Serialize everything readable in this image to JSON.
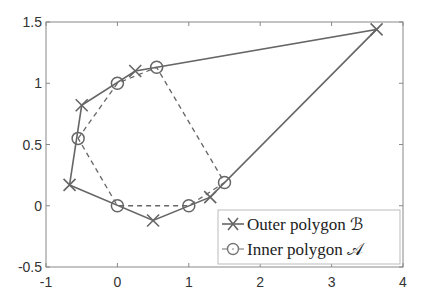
{
  "chart_data": {
    "type": "line",
    "title": "",
    "xlabel": "",
    "ylabel": "",
    "xlim": [
      -1,
      4
    ],
    "ylim": [
      -0.5,
      1.5
    ],
    "xticks": [
      -1,
      0,
      1,
      2,
      3,
      4
    ],
    "xtick_labels": [
      "-1",
      "0",
      "1",
      "2",
      "3",
      "4"
    ],
    "yticks": [
      -0.5,
      0,
      0.5,
      1,
      1.5
    ],
    "ytick_labels": [
      "-0.5",
      "0",
      "0.5",
      "1",
      "1.5"
    ],
    "grid": false,
    "legend_position": "lower right",
    "series": [
      {
        "name": "Outer polygon ℬ",
        "marker": "x",
        "linestyle": "solid",
        "color": "#666666",
        "closed": true,
        "points": [
          [
            -0.67,
            0.17
          ],
          [
            -0.5,
            0.82
          ],
          [
            0.25,
            1.1
          ],
          [
            3.63,
            1.44
          ],
          [
            1.3,
            0.07
          ],
          [
            0.5,
            -0.12
          ]
        ]
      },
      {
        "name": "Inner polygon 𝒜",
        "marker": "o",
        "linestyle": "dashed",
        "color": "#666666",
        "closed": true,
        "points": [
          [
            -0.55,
            0.55
          ],
          [
            0.0,
            1.0
          ],
          [
            0.55,
            1.13
          ],
          [
            1.5,
            0.19
          ],
          [
            1.0,
            0.0
          ],
          [
            0.0,
            0.0
          ]
        ]
      }
    ]
  },
  "legend": {
    "outer_label": "Outer polygon ℬ",
    "inner_label": "Inner polygon 𝒜"
  }
}
